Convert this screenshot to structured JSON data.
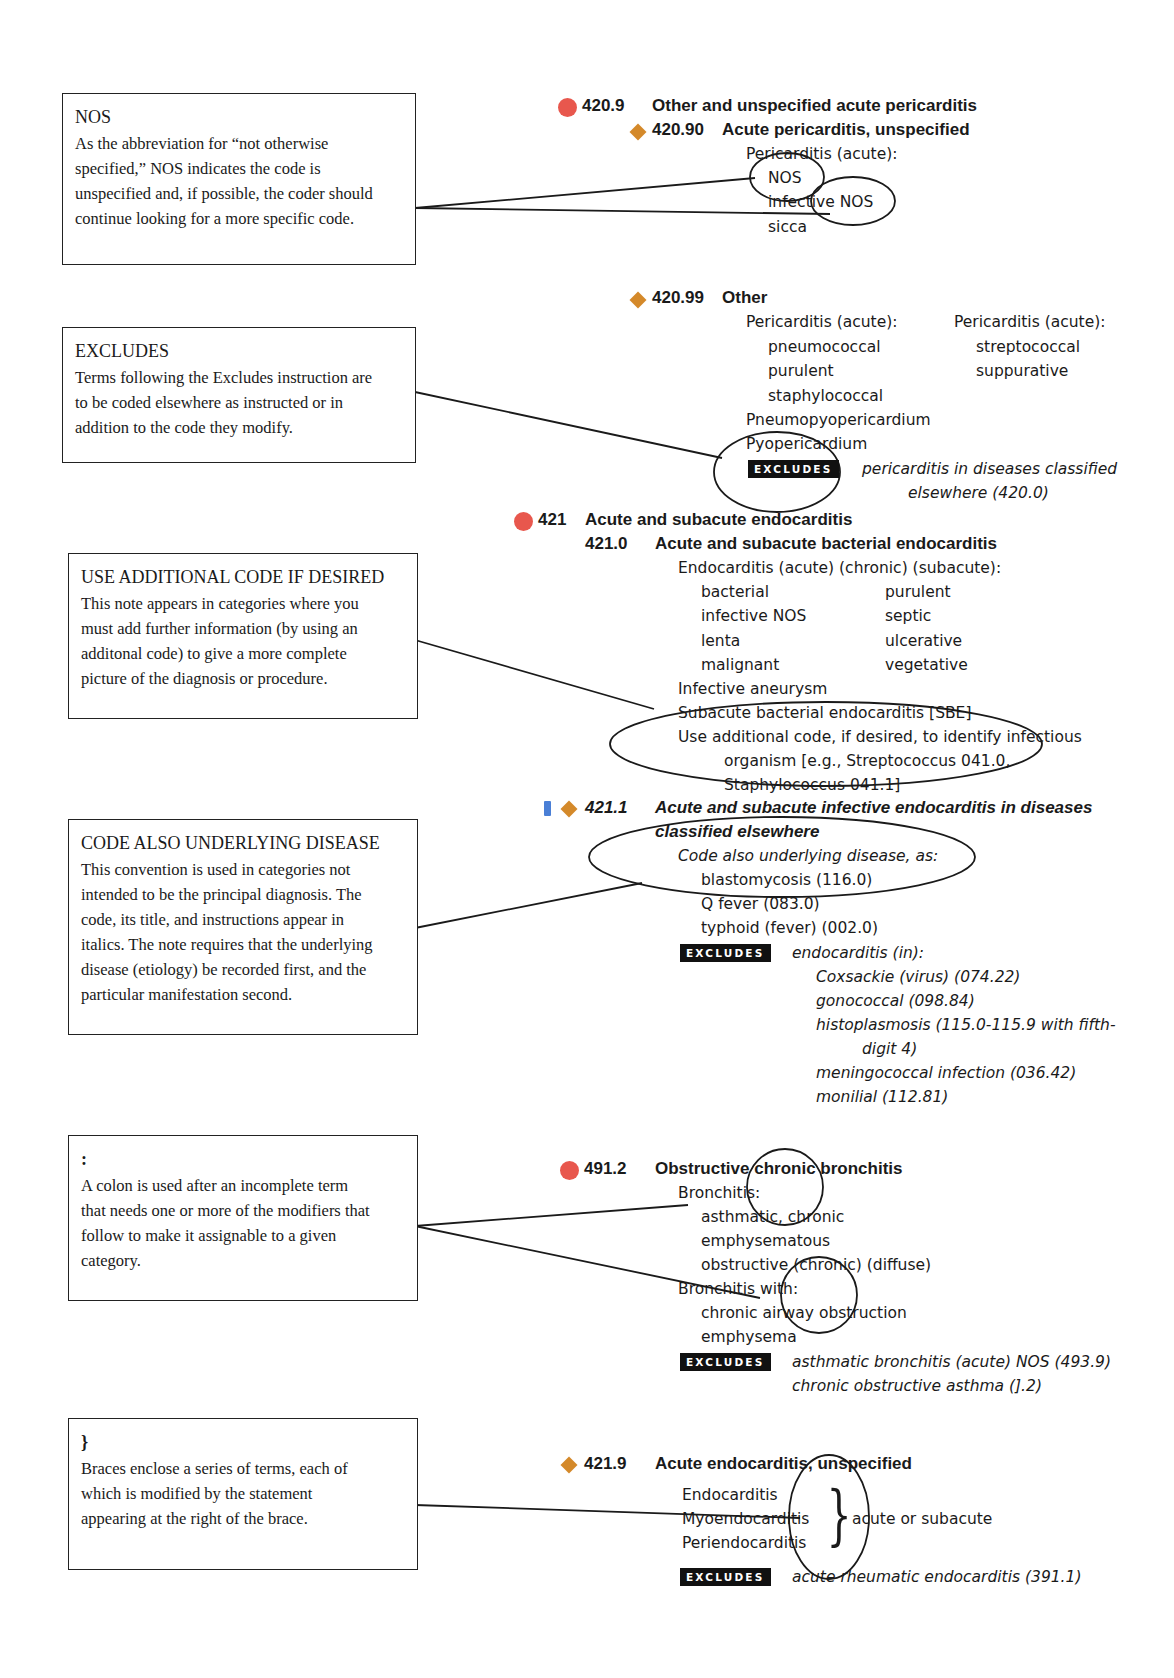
{
  "notes": [
    {
      "title": "NOS",
      "lines": [
        "As the abbreviation for “not otherwise",
        "specified,” NOS indicates the code is",
        "unspecified and, if possible, the coder should",
        "continue looking for a more specific code."
      ]
    },
    {
      "title": "EXCLUDES",
      "lines": [
        "Terms following the Excludes instruction are",
        "to be coded elsewhere as instructed or in",
        "addition to the code they modify."
      ]
    },
    {
      "title": "USE ADDITIONAL CODE IF DESIRED",
      "lines": [
        "This note appears in categories where you",
        "must add further information (by using an",
        "additonal code) to give a more complete",
        "picture of the diagnosis or procedure."
      ]
    },
    {
      "title": "CODE ALSO UNDERLYING DISEASE",
      "lines": [
        "This convention is used in categories not",
        "intended to be the principal diagnosis. The",
        "code, its title, and instructions appear in",
        "italics. The note requires that the underlying",
        "disease (etiology) be recorded first, and the",
        "particular manifestation second."
      ]
    },
    {
      "title": ":",
      "lines": [
        "A colon is used after an incomplete term",
        "that needs one or more of the modifiers that",
        "follow to make it assignable to a given",
        "category."
      ]
    },
    {
      "title": "}",
      "lines": [
        "Braces enclose a series of terms, each of",
        "which is modified by the statement",
        "appearing at the right of the brace."
      ]
    }
  ],
  "excludes_label": "EXCLUDES",
  "entries": {
    "e4209": {
      "code": "420.9",
      "title": "Other and unspecified acute pericarditis"
    },
    "e42090": {
      "code": "420.90",
      "title": "Acute pericarditis, unspecified",
      "lines": [
        "Pericarditis (acute):",
        "NOS",
        "infective NOS",
        "sicca"
      ]
    },
    "e42099": {
      "code": "420.99",
      "title": "Other",
      "col1": [
        "Pericarditis (acute):",
        "pneumococcal",
        "purulent",
        "staphylococcal",
        "Pneumopyopericardium",
        "Pyopericardium"
      ],
      "col2": [
        "Pericarditis (acute):",
        "streptococcal",
        "suppurative"
      ],
      "excludes": [
        "pericarditis in diseases classified",
        "elsewhere (420.0)"
      ]
    },
    "e421": {
      "code": "421",
      "title": "Acute and subacute endocarditis"
    },
    "e4210": {
      "code": "421.0",
      "title": "Acute and subacute bacterial endocarditis",
      "intro": "Endocarditis (acute) (chronic) (subacute):",
      "col1": [
        "bacterial",
        "infective NOS",
        "lenta",
        "malignant"
      ],
      "col2": [
        "purulent",
        "septic",
        "ulcerative",
        "vegetative"
      ],
      "after": [
        "Infective aneurysm",
        "Subacute bacterial endocarditis [SBE]",
        "Use additional code, if desired, to identify infectious",
        "organism [e.g., Streptococcus 041.0,",
        "Staphylococcus 041.1]"
      ]
    },
    "e4211": {
      "code": "421.1",
      "title": "Acute and subacute infective endocarditis in diseases",
      "title2": "classified elsewhere",
      "note": "Code also underlying disease, as:",
      "lines": [
        "blastomycosis (116.0)",
        "Q fever (083.0)",
        "typhoid (fever) (002.0)"
      ],
      "excludes": [
        "endocarditis (in):",
        "Coxsackie (virus) (074.22)",
        "gonococcal (098.84)",
        "histoplasmosis (115.0-115.9 with fifth-",
        "digit 4)",
        "meningococcal infection (036.42)",
        "monilial (112.81)"
      ]
    },
    "e4912": {
      "code": "491.2",
      "title": "Obstructive chronic bronchitis",
      "lines": [
        "Bronchitis:",
        "asthmatic, chronic",
        "emphysematous",
        "obstructive (chronic) (diffuse)",
        "Bronchitis with:",
        "chronic airway obstruction",
        "emphysema"
      ],
      "excludes": [
        "asthmatic bronchitis (acute) NOS (493.9)",
        "chronic obstructive asthma (].2)"
      ]
    },
    "e4219": {
      "code": "421.9",
      "title": "Acute endocarditis, unspecified",
      "lines": [
        "Endocarditis",
        "Myoendocarditis",
        "Periendocarditis"
      ],
      "brace_text": "acute or subacute",
      "excludes": [
        "acute rheumatic endocarditis (391.1)"
      ]
    }
  },
  "colors": {
    "red_dot": "#e8574d",
    "orange_diamond": "#d4892a",
    "blue_marker": "#4a7fd6"
  }
}
